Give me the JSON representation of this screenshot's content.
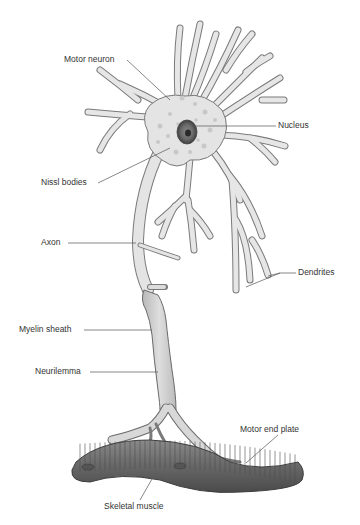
{
  "diagram": {
    "type": "anatomical-illustration",
    "labels": {
      "motor_neuron": "Motor neuron",
      "nucleus": "Nucleus",
      "nissl_bodies": "Nissl bodies",
      "axon": "Axon",
      "dendrites": "Dendrites",
      "myelin_sheath": "Myelin sheath",
      "neurilemma": "Neurilemma",
      "motor_end_plate": "Motor end plate",
      "skeletal_muscle": "Skeletal muscle"
    },
    "colors": {
      "cell_fill": "#e4e4e4",
      "cell_stroke": "#7a7a7a",
      "nissl": "#c8c8c8",
      "nucleus_outer": "#6a6a6a",
      "nucleus_inner": "#3a3a3a",
      "myelin": "#cfcfcf",
      "muscle": "#6e6e6e",
      "muscle_striation": "#4e4e4e",
      "leader_line": "#555555",
      "label_text": "#333333"
    }
  }
}
